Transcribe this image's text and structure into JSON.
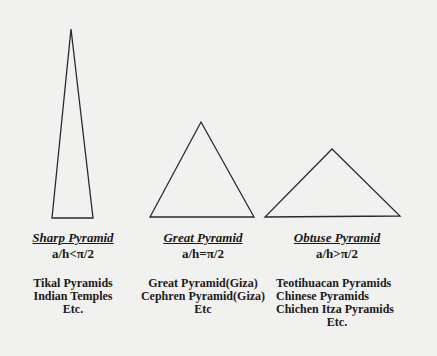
{
  "diagram": {
    "background": "#f1f1f0",
    "stroke_color": "#2a2a2a",
    "pyramids": [
      {
        "id": "sharp",
        "title_words": [
          "Sharp",
          "Pyramid"
        ],
        "title": "Sharp Pyramid",
        "formula": "a/h<π/2",
        "examples": [
          "Tikal Pyramids",
          "Indian Temples",
          "Etc."
        ],
        "triangle": {
          "apex": [
            71,
            29
          ],
          "base_left": [
            52,
            218
          ],
          "base_right": [
            93,
            218
          ]
        }
      },
      {
        "id": "great",
        "title": "Great Pyramid",
        "formula": "a/h=π/2",
        "examples": [
          "Great Pyramid(Giza)",
          "Cephren Pyramid(Giza)",
          "Etc"
        ],
        "triangle": {
          "apex": [
            201,
            122
          ],
          "base_left": [
            150,
            217
          ],
          "base_right": [
            254,
            217
          ]
        }
      },
      {
        "id": "obtuse",
        "title": "Obtuse Pyramid",
        "formula": "a/h>π/2",
        "examples": [
          "Teotihuacan Pyramids",
          "Chinese Pyramids",
          "Chichen Itza Pyramids",
          "Etc."
        ],
        "triangle": {
          "apex": [
            332,
            149
          ],
          "base_left": [
            265,
            217
          ],
          "base_right": [
            400,
            216
          ]
        }
      }
    ]
  }
}
